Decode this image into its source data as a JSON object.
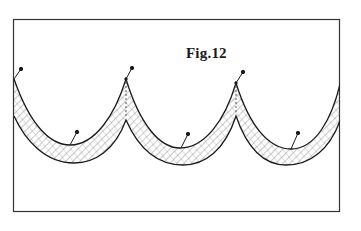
{
  "figure": {
    "label": "Fig.12",
    "colors": {
      "ink": "#1a1a1a",
      "frame": "#333333",
      "hatch": "#555555",
      "background": "#ffffff"
    },
    "frame": {
      "x": 13,
      "y": 19,
      "width": 327,
      "height": 193
    },
    "swags": [
      {
        "id": 1,
        "from_cusp_x": 14,
        "to_cusp_x": 126,
        "trough_top": [
          70,
          145
        ],
        "trough_bottom": [
          74,
          163
        ]
      },
      {
        "id": 2,
        "from_cusp_x": 126,
        "to_cusp_x": 236,
        "trough_top": [
          180,
          148
        ],
        "trough_bottom": [
          183,
          165
        ]
      },
      {
        "id": 3,
        "from_cusp_x": 236,
        "to_cusp_x": 340,
        "trough_top": [
          291,
          149
        ],
        "trough_bottom": [
          286,
          165
        ]
      }
    ],
    "pins": [
      {
        "position": "cusp-left",
        "head": [
          21,
          69
        ],
        "tip": [
          14,
          79
        ]
      },
      {
        "position": "cusp-1",
        "head": [
          132,
          68
        ],
        "tip": [
          126,
          79
        ]
      },
      {
        "position": "cusp-2",
        "head": [
          243,
          72
        ],
        "tip": [
          236,
          83
        ]
      },
      {
        "position": "trough-1",
        "head": [
          77,
          132
        ],
        "tip": [
          70,
          145
        ]
      },
      {
        "position": "trough-2",
        "head": [
          188,
          134
        ],
        "tip": [
          181,
          148
        ]
      },
      {
        "position": "trough-3",
        "head": [
          298,
          133
        ],
        "tip": [
          291,
          149
        ]
      }
    ]
  }
}
